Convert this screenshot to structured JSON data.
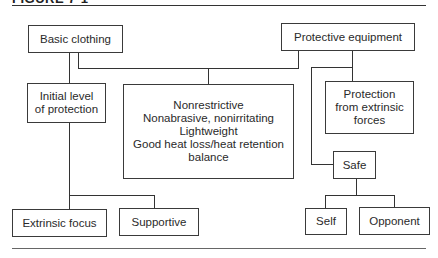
{
  "figure": {
    "title": "FIGURE 7-1"
  },
  "nodes": {
    "basic_clothing": "Basic clothing",
    "protective_equipment": "Protective equipment",
    "initial_level": "Initial level\nof protection",
    "center_properties": "Nonrestrictive\nNonabrasive, nonirritating\nLightweight\nGood heat loss/heat retention\nbalance",
    "protection_extrinsic": "Protection\nfrom extrinsic\nforces",
    "safe": "Safe",
    "extrinsic_focus": "Extrinsic focus",
    "supportive": "Supportive",
    "self": "Self",
    "opponent": "Opponent"
  },
  "colors": {
    "line": "#333333",
    "text": "#2a2a2a",
    "background": "#ffffff"
  }
}
